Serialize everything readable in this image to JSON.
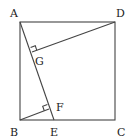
{
  "diagram": {
    "type": "geometry",
    "points": {
      "A": {
        "label": "A",
        "x": 20,
        "y": 22,
        "lx": 10,
        "ly": 17
      },
      "B": {
        "label": "B",
        "x": 20,
        "y": 120,
        "lx": 10,
        "ly": 136
      },
      "C": {
        "label": "C",
        "x": 115,
        "y": 120,
        "lx": 117,
        "ly": 136
      },
      "D": {
        "label": "D",
        "x": 115,
        "y": 22,
        "lx": 116,
        "ly": 17
      },
      "E": {
        "label": "E",
        "x": 54,
        "y": 120,
        "lx": 50,
        "ly": 136
      },
      "F": {
        "label": "F",
        "x": 49,
        "y": 109,
        "lx": 56,
        "ly": 111
      },
      "G": {
        "label": "G",
        "x": 32,
        "y": 52,
        "lx": 35,
        "ly": 65
      }
    },
    "segments": [
      [
        "A",
        "B"
      ],
      [
        "B",
        "C"
      ],
      [
        "C",
        "D"
      ],
      [
        "D",
        "A"
      ],
      [
        "A",
        "E"
      ],
      [
        "D",
        "G"
      ],
      [
        "B",
        "F"
      ]
    ],
    "right_angles": [
      "G",
      "F"
    ],
    "line_color": "#444444"
  }
}
